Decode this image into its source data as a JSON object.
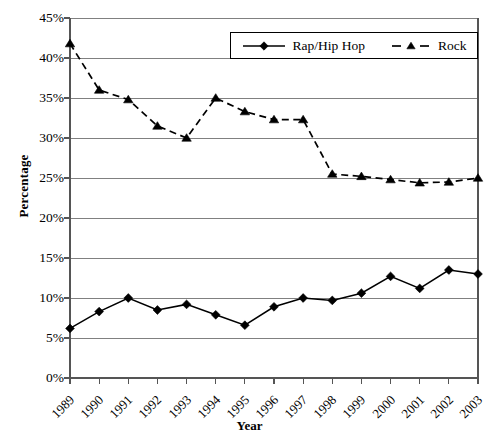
{
  "chart_data": {
    "type": "line",
    "title": "",
    "xlabel": "Year",
    "ylabel": "Percentage",
    "categories": [
      "1989",
      "1990",
      "1991",
      "1992",
      "1993",
      "1994",
      "1995",
      "1996",
      "1997",
      "1998",
      "1999",
      "2000",
      "2001",
      "2002",
      "2003"
    ],
    "x": [
      1989,
      1990,
      1991,
      1992,
      1993,
      1994,
      1995,
      1996,
      1997,
      1998,
      1999,
      2000,
      2001,
      2002,
      2003
    ],
    "ylim": [
      0,
      45
    ],
    "ytick_labels": [
      "0%",
      "5%",
      "10%",
      "15%",
      "20%",
      "25%",
      "30%",
      "35%",
      "40%",
      "45%"
    ],
    "ytick_values": [
      0,
      5,
      10,
      15,
      20,
      25,
      30,
      35,
      40,
      45
    ],
    "ytick_suffix": "%",
    "grid": true,
    "legend_position": "top-right-inside",
    "series": [
      {
        "name": "Rap/Hip Hop",
        "marker": "diamond",
        "line_style": "solid",
        "color": "#000000",
        "values": [
          6.2,
          8.3,
          10.0,
          8.5,
          9.2,
          7.9,
          6.6,
          8.9,
          10.0,
          9.7,
          10.6,
          12.7,
          11.2,
          13.5,
          13.0
        ]
      },
      {
        "name": "Rock",
        "marker": "triangle",
        "line_style": "dashed",
        "color": "#000000",
        "values": [
          41.8,
          36.0,
          34.8,
          31.5,
          30.0,
          35.0,
          33.3,
          32.3,
          32.3,
          25.5,
          25.2,
          24.8,
          24.4,
          24.5,
          25.0
        ]
      }
    ]
  },
  "legend": {
    "entries": [
      {
        "label": "Rap/Hip Hop"
      },
      {
        "label": "Rock"
      }
    ]
  },
  "axes": {
    "x_title": "Year",
    "y_title": "Percentage"
  }
}
